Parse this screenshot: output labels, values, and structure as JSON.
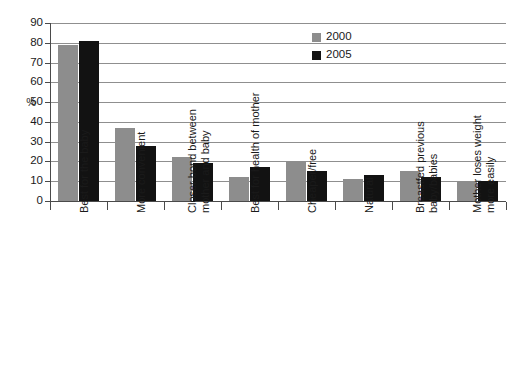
{
  "chart_data": {
    "type": "bar",
    "title": "",
    "xlabel": "",
    "ylabel": "%",
    "ylim": [
      0,
      90
    ],
    "ytick_step": 10,
    "yticks": [
      90,
      80,
      70,
      60,
      50,
      40,
      30,
      20,
      10,
      0
    ],
    "grid": true,
    "legend_position": "top-right-inside",
    "categories": [
      "Best for the baby",
      "More convenient",
      "Closer bond between mother and baby",
      "Best for health of mother",
      "Cheaper/free",
      "Natural",
      "Breastfed previous baby/babies",
      "Mother loses weight more easily"
    ],
    "category_lines": [
      [
        "Best for the baby"
      ],
      [
        "More convenient"
      ],
      [
        "Closer bond between",
        "mother and baby"
      ],
      [
        "Best for health of mother"
      ],
      [
        "Cheaper/free"
      ],
      [
        "Natural"
      ],
      [
        "Breastfed previous",
        "baby/babies"
      ],
      [
        "Mother loses weight",
        "more easily"
      ]
    ],
    "series": [
      {
        "name": "2000",
        "color": "#8d8d8d",
        "values": [
          79,
          37,
          22,
          12,
          20,
          11,
          15,
          10
        ]
      },
      {
        "name": "2005",
        "color": "#121212",
        "values": [
          81,
          28,
          19,
          17,
          15,
          13,
          12,
          10
        ]
      }
    ]
  },
  "legend": {
    "items": [
      {
        "label": "2000",
        "series_key": "s2000"
      },
      {
        "label": "2005",
        "series_key": "s2005"
      }
    ]
  },
  "axis": {
    "y_title": "%"
  }
}
